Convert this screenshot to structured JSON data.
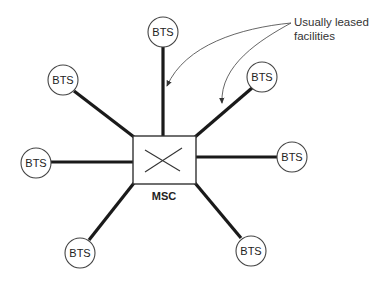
{
  "diagram": {
    "center": {
      "label": "MSC",
      "box": {
        "x": 133,
        "y": 136,
        "w": 63,
        "h": 48
      },
      "symbol": "crossed-switch"
    },
    "stations": [
      {
        "id": "bts-top",
        "label": "BTS",
        "cx": 163,
        "cy": 32,
        "line": [
          163,
          47,
          163,
          136
        ]
      },
      {
        "id": "bts-upper-left",
        "label": "BTS",
        "cx": 63,
        "cy": 80,
        "line": [
          74,
          91,
          133,
          136
        ]
      },
      {
        "id": "bts-upper-right",
        "label": "BTS",
        "cx": 262,
        "cy": 77,
        "line": [
          252,
          88,
          196,
          136
        ]
      },
      {
        "id": "bts-left",
        "label": "BTS",
        "cx": 36,
        "cy": 163,
        "line": [
          51,
          162,
          133,
          162
        ]
      },
      {
        "id": "bts-right",
        "label": "BTS",
        "cx": 292,
        "cy": 157,
        "line": [
          277,
          157,
          196,
          157
        ]
      },
      {
        "id": "bts-lower-left",
        "label": "BTS",
        "cx": 80,
        "cy": 253,
        "line": [
          89,
          240,
          133,
          184
        ]
      },
      {
        "id": "bts-lower-right",
        "label": "BTS",
        "cx": 251,
        "cy": 251,
        "line": [
          241,
          238,
          196,
          184
        ]
      }
    ],
    "annotation": {
      "line1": "Usually leased",
      "line2": "facilities",
      "arrow_targets": [
        "bts-top link",
        "bts-upper-right link"
      ]
    },
    "colors": {
      "line": "#1a1a1a",
      "circle_stroke": "#444444",
      "background": "#ffffff"
    }
  }
}
